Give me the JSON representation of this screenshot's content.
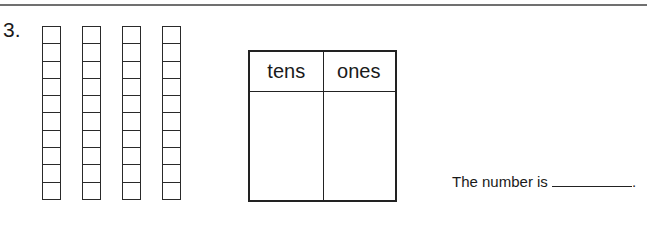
{
  "question": {
    "number": "3.",
    "rods": {
      "count": 4,
      "cubes_per_rod": 10,
      "x_positions": [
        42,
        82,
        122,
        162
      ]
    },
    "table": {
      "headers": [
        "tens",
        "ones"
      ],
      "values": [
        "",
        ""
      ]
    },
    "answer_prompt": "The number is",
    "answer_value": "",
    "answer_suffix": "."
  }
}
